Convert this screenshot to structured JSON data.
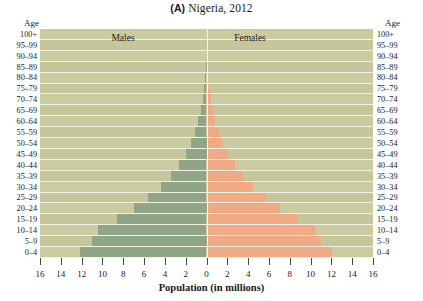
{
  "title": {
    "panel": "(A)",
    "text": "Nigeria, 2012",
    "full": "(A) Nigeria, 2012"
  },
  "axes": {
    "age_header_left": "Age",
    "age_header_right": "Age",
    "x_axis_title": "Population (in millions)",
    "x_tick_labels": [
      "16",
      "14",
      "12",
      "10",
      "8",
      "6",
      "4",
      "2",
      "0",
      "2",
      "4",
      "6",
      "8",
      "10",
      "12",
      "14",
      "16"
    ]
  },
  "legend": {
    "males": "Males",
    "females": "Females"
  },
  "colors": {
    "male_bar": "#90a585",
    "female_bar": "#f0ab86",
    "plot_background": "#cbcba2",
    "plot_background_alt": "#c5c69b",
    "gridline": "#f2f2e4",
    "text": "#1a1a1a"
  },
  "chart_data": {
    "type": "bar",
    "subtype": "population-pyramid",
    "title": "(A) Nigeria, 2012",
    "xlabel": "Population (in millions)",
    "ylabel": "Age",
    "xlim": [
      -16,
      16
    ],
    "xticks": [
      -16,
      -14,
      -12,
      -10,
      -8,
      -6,
      -4,
      -2,
      0,
      2,
      4,
      6,
      8,
      10,
      12,
      14,
      16
    ],
    "xtick_labels": [
      "16",
      "14",
      "12",
      "10",
      "8",
      "6",
      "4",
      "2",
      "0",
      "2",
      "4",
      "6",
      "8",
      "10",
      "12",
      "14",
      "16"
    ],
    "grid": true,
    "legend_position": "inside-top",
    "categories": [
      "100+",
      "95-99",
      "90-94",
      "85-89",
      "80-84",
      "75-79",
      "70-74",
      "65-69",
      "60-64",
      "55-59",
      "50-54",
      "45-49",
      "40-44",
      "35-39",
      "30-34",
      "25-29",
      "20-24",
      "15-19",
      "10-14",
      "5-9",
      "0-4"
    ],
    "series": [
      {
        "name": "Males",
        "color": "#90a585",
        "side": "left",
        "values": [
          0.0,
          0.0,
          0.0,
          0.05,
          0.12,
          0.2,
          0.35,
          0.55,
          0.8,
          1.1,
          1.5,
          2.0,
          2.6,
          3.4,
          4.4,
          5.6,
          7.0,
          8.6,
          10.4,
          11.0,
          12.2
        ]
      },
      {
        "name": "Females",
        "color": "#f0ab86",
        "side": "right",
        "values": [
          0.0,
          0.0,
          0.02,
          0.06,
          0.14,
          0.24,
          0.4,
          0.6,
          0.85,
          1.2,
          1.6,
          2.1,
          2.7,
          3.5,
          4.5,
          5.7,
          7.1,
          8.7,
          10.4,
          11.0,
          12.1
        ]
      }
    ]
  }
}
